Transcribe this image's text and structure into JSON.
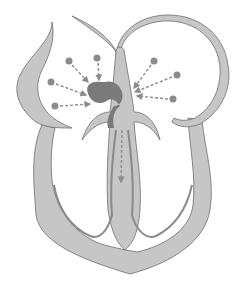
{
  "diagram": {
    "colors": {
      "background": "#ffffff",
      "tissue_fill": "#c6c6c6",
      "tissue_stroke": "#6e6e6e",
      "inner_line": "#8a8a8a",
      "node_fill": "#7a7a7a",
      "dot_fill": "#8c8c8c",
      "arrow": "#8c8c8c"
    },
    "left_signal_dots": [
      {
        "x": 69,
        "y": 61
      },
      {
        "x": 97,
        "y": 58
      },
      {
        "x": 51,
        "y": 82
      },
      {
        "x": 55,
        "y": 106
      }
    ],
    "right_signal_dots": [
      {
        "x": 154,
        "y": 61
      },
      {
        "x": 177,
        "y": 75
      },
      {
        "x": 173,
        "y": 99
      }
    ],
    "labels": []
  }
}
